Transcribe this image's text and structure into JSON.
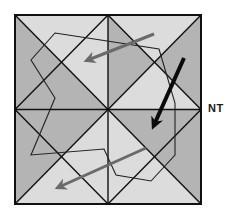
{
  "diagram": {
    "label": "NT",
    "colors": {
      "dark_region": "#b4b4b4",
      "light_region": "#dcdcdc",
      "line": "#111111",
      "gray_arrow": "#6a6a6a",
      "black_arrow": "#0a0a0a",
      "background": "#ffffff"
    },
    "frame": {
      "left": 15,
      "top": 15,
      "right": 201,
      "bottom": 204
    },
    "polygon_points": "55,33 159,49 175,103 175,155 151,181 116,175 104,149 31,155 55,98 31,60",
    "arrows": [
      {
        "name": "gray-arrow-top",
        "from": [
          154,
          34
        ],
        "to": [
          86,
          61
        ],
        "color": "gray"
      },
      {
        "name": "black-arrow-right",
        "from": [
          184,
          58
        ],
        "to": [
          152,
          128
        ],
        "color": "black"
      },
      {
        "name": "gray-arrow-bottom",
        "from": [
          146,
          148
        ],
        "to": [
          56,
          188
        ],
        "color": "gray"
      }
    ]
  }
}
